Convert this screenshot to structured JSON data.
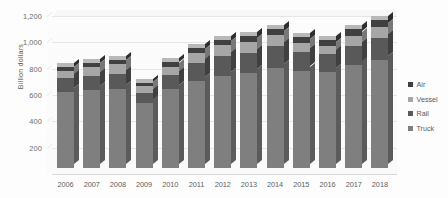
{
  "chart_data": {
    "type": "bar",
    "stacked": true,
    "title": "",
    "xlabel": "",
    "ylabel": "Billion dollars",
    "ylim": [
      0,
      1200
    ],
    "yticks": [
      "200",
      "400",
      "600",
      "800",
      "1,000",
      "1,200"
    ],
    "ytick_values": [
      200,
      400,
      600,
      800,
      1000,
      1200
    ],
    "grid": true,
    "legend_position": "right",
    "categories": [
      "2006",
      "2007",
      "2008",
      "2009",
      "2010",
      "2011",
      "2012",
      "2013",
      "2014",
      "2015",
      "2016",
      "2017",
      "2018"
    ],
    "series": [
      {
        "name": "Truck",
        "color": "#7f7f7f",
        "values": [
          575,
          590,
          600,
          490,
          600,
          660,
          700,
          720,
          760,
          740,
          730,
          780,
          820
        ]
      },
      {
        "name": "Rail",
        "color": "#595959",
        "values": [
          105,
          110,
          115,
          80,
          110,
          135,
          150,
          155,
          165,
          140,
          135,
          150,
          165
        ]
      },
      {
        "name": "Vessel",
        "color": "#a6a6a6",
        "values": [
          60,
          65,
          75,
          50,
          60,
          80,
          85,
          85,
          85,
          70,
          65,
          75,
          85
        ]
      },
      {
        "name": "Air",
        "color": "#404040",
        "values": [
          30,
          32,
          33,
          25,
          33,
          38,
          40,
          42,
          45,
          42,
          42,
          48,
          55
        ]
      }
    ],
    "totals": [
      770,
      797,
      823,
      645,
      803,
      913,
      975,
      1002,
      1055,
      992,
      972,
      1053,
      1125
    ]
  },
  "legend": {
    "items": [
      {
        "label": "Air",
        "color": "#404040"
      },
      {
        "label": "Vessel",
        "color": "#a6a6a6"
      },
      {
        "label": "Rail",
        "color": "#595959"
      },
      {
        "label": "Truck",
        "color": "#7f7f7f"
      }
    ]
  },
  "colors": {
    "background": "#ffffff",
    "gridline": "#e6e6e6",
    "text": "#5a5a5a"
  }
}
